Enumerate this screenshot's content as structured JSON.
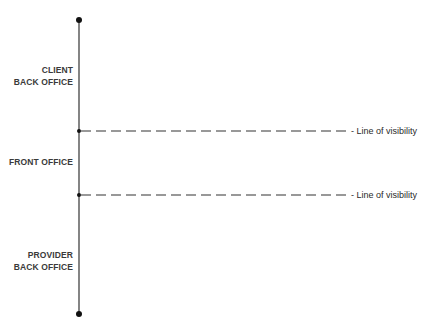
{
  "diagram": {
    "zones": [
      {
        "line1": "CLIENT",
        "line2": "BACK OFFICE"
      },
      {
        "line1": "FRONT OFFICE"
      },
      {
        "line1": "PROVIDER",
        "line2": "BACK OFFICE"
      }
    ],
    "visibility_lines": [
      {
        "label": "- Line of visibility"
      },
      {
        "label": "- Line of visibility"
      }
    ],
    "colors": {
      "line": "#222222",
      "text": "#3a3a3a"
    }
  }
}
